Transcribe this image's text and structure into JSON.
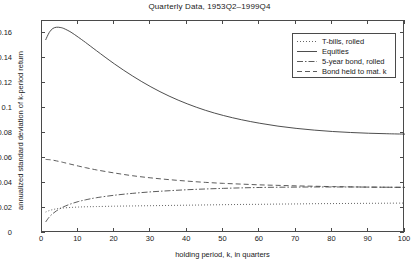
{
  "chart_data": {
    "type": "line",
    "title": "Quarterly Data, 1953Q2–1999Q4",
    "xlabel": "holding period, k, in quarters",
    "ylabel": "annualized standard deviation of k-period return",
    "xlim": [
      0,
      100
    ],
    "ylim": [
      0,
      0.17
    ],
    "grid": false,
    "legend_position": "upper right",
    "xticks": [
      0,
      10,
      20,
      30,
      40,
      50,
      60,
      70,
      80,
      90,
      100
    ],
    "xtick_labels": [
      "0",
      "10",
      "20",
      "30",
      "40",
      "50",
      "60",
      "70",
      "80",
      "90",
      "100"
    ],
    "yticks": [
      0,
      0.02,
      0.04,
      0.06,
      0.08,
      0.1,
      0.12,
      0.14,
      0.16
    ],
    "ytick_labels": [
      "0",
      "0.02",
      "0.04",
      "0.06",
      "0.08",
      "0.1",
      "0.12",
      "0.14",
      "0.16"
    ],
    "x": [
      1,
      2,
      3,
      4,
      5,
      6,
      8,
      10,
      12,
      15,
      20,
      25,
      30,
      35,
      40,
      45,
      50,
      55,
      60,
      65,
      70,
      75,
      80,
      85,
      90,
      95,
      100
    ],
    "series": [
      {
        "name": "T-bills, rolled",
        "style": "dotted",
        "color": "#555555",
        "values": [
          0.0168,
          0.018,
          0.0188,
          0.0194,
          0.0198,
          0.0201,
          0.0205,
          0.0208,
          0.021,
          0.0212,
          0.0215,
          0.0217,
          0.0219,
          0.0221,
          0.0223,
          0.0225,
          0.0227,
          0.0229,
          0.023,
          0.0232,
          0.0233,
          0.0235,
          0.0236,
          0.0237,
          0.0238,
          0.0239,
          0.024
        ]
      },
      {
        "name": "Equities",
        "style": "solid",
        "color": "#3a3a3a",
        "values": [
          0.1548,
          0.1608,
          0.164,
          0.165,
          0.1648,
          0.164,
          0.161,
          0.157,
          0.1528,
          0.1462,
          0.1355,
          0.1258,
          0.1172,
          0.1098,
          0.1036,
          0.0984,
          0.0942,
          0.0908,
          0.088,
          0.0857,
          0.0839,
          0.0825,
          0.0814,
          0.0806,
          0.08,
          0.0796,
          0.0793
        ]
      },
      {
        "name": "5-year bond, rolled",
        "style": "dashdot",
        "color": "#4a4a4a",
        "values": [
          0.0088,
          0.0128,
          0.0156,
          0.0178,
          0.0196,
          0.0211,
          0.0234,
          0.0252,
          0.0266,
          0.0283,
          0.0303,
          0.0318,
          0.033,
          0.0339,
          0.0347,
          0.0353,
          0.0358,
          0.0362,
          0.0365,
          0.0367,
          0.0368,
          0.0369,
          0.0369,
          0.0369,
          0.0368,
          0.0367,
          0.0366
        ]
      },
      {
        "name": "Bond held to mat. k",
        "style": "dashed",
        "color": "#4a4a4a",
        "values": [
          0.059,
          0.0588,
          0.0584,
          0.0578,
          0.0572,
          0.0565,
          0.0551,
          0.0537,
          0.0524,
          0.0506,
          0.0481,
          0.0459,
          0.0442,
          0.0428,
          0.0416,
          0.0406,
          0.0398,
          0.0392,
          0.0386,
          0.0382,
          0.0378,
          0.0375,
          0.0372,
          0.037,
          0.0368,
          0.0367,
          0.0366
        ]
      }
    ]
  }
}
